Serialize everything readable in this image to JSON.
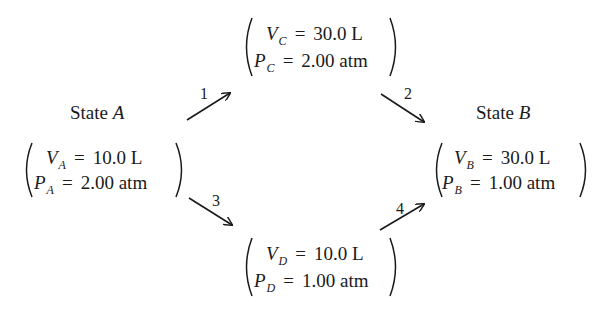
{
  "states": {
    "A": {
      "title_prefix": "State ",
      "title_letter": "A",
      "volume": {
        "symbol": "V",
        "subscript": "A",
        "eq": "=",
        "value": "10.0 L"
      },
      "pressure": {
        "symbol": "P",
        "subscript": "A",
        "eq": "=",
        "value": "2.00 atm"
      }
    },
    "B": {
      "title_prefix": "State ",
      "title_letter": "B",
      "volume": {
        "symbol": "V",
        "subscript": "B",
        "eq": "=",
        "value": "30.0 L"
      },
      "pressure": {
        "symbol": "P",
        "subscript": "B",
        "eq": "=",
        "value": "1.00 atm"
      }
    },
    "C": {
      "volume": {
        "symbol": "V",
        "subscript": "C",
        "eq": "=",
        "value": "30.0 L"
      },
      "pressure": {
        "symbol": "P",
        "subscript": "C",
        "eq": "=",
        "value": "2.00 atm"
      }
    },
    "D": {
      "volume": {
        "symbol": "V",
        "subscript": "D",
        "eq": "=",
        "value": "10.0 L"
      },
      "pressure": {
        "symbol": "P",
        "subscript": "D",
        "eq": "=",
        "value": "1.00 atm"
      }
    }
  },
  "steps": [
    {
      "label": "1",
      "from": "A",
      "to": "C"
    },
    {
      "label": "2",
      "from": "C",
      "to": "B"
    },
    {
      "label": "3",
      "from": "A",
      "to": "D"
    },
    {
      "label": "4",
      "from": "D",
      "to": "B"
    }
  ],
  "colors": {
    "text": "#1a1a1a",
    "background": "#ffffff"
  }
}
